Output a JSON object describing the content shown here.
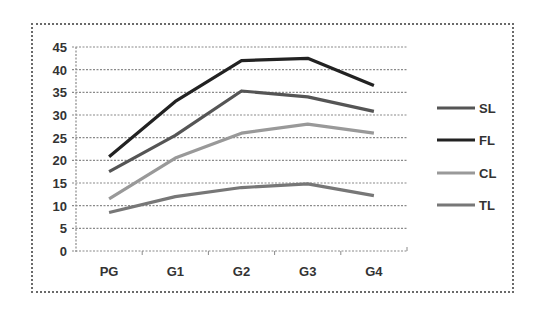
{
  "chart_data": {
    "type": "line",
    "title": "",
    "xlabel": "",
    "ylabel": "",
    "categories": [
      "PG",
      "G1",
      "G2",
      "G3",
      "G4"
    ],
    "ylim": [
      0,
      45
    ],
    "yticks": [
      0,
      5,
      10,
      15,
      20,
      25,
      30,
      35,
      40,
      45
    ],
    "grid": true,
    "legend_position": "right",
    "series": [
      {
        "name": "SL",
        "color": "#555555",
        "values": [
          17.5,
          25.5,
          35.3,
          34,
          30.8
        ]
      },
      {
        "name": "FL",
        "color": "#222222",
        "values": [
          20.8,
          33,
          42,
          42.5,
          36.5
        ]
      },
      {
        "name": "CL",
        "color": "#999999",
        "values": [
          11.5,
          20.5,
          26,
          28,
          26
        ]
      },
      {
        "name": "TL",
        "color": "#777777",
        "values": [
          8.5,
          12,
          14,
          14.8,
          12.2
        ]
      }
    ]
  }
}
